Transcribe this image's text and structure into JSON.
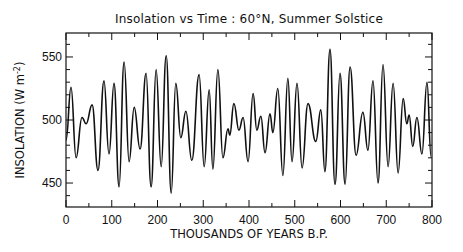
{
  "chart_data": {
    "type": "line",
    "title": "Insolation vs Time : 60°N, Summer Solstice",
    "xlabel": "THOUSANDS OF YEARS B.P.",
    "ylabel": "INSOLATION (W m",
    "ylabel_exp": "-2",
    "ylabel_close": ")",
    "xlim": [
      0,
      800
    ],
    "ylim": [
      431,
      569
    ],
    "x_ticks": [
      0,
      100,
      200,
      300,
      400,
      500,
      600,
      700,
      800
    ],
    "x_tick_labels": [
      "0",
      "100",
      "200",
      "300",
      "400",
      "500",
      "600",
      "700",
      "800"
    ],
    "x_minor_step": 50,
    "y_ticks": [
      450,
      500,
      550
    ],
    "y_tick_labels": [
      "450",
      "500",
      "550"
    ],
    "y_minor_step": 10,
    "grid": false,
    "series": [
      {
        "name": "Insolation",
        "color": "#111111",
        "x": [
          0,
          11,
          22,
          35,
          44,
          57,
          70,
          83,
          94,
          105,
          116,
          127,
          138,
          149,
          162,
          175,
          186,
          197,
          208,
          219,
          230,
          240,
          251,
          262,
          275,
          291,
          302,
          313,
          321,
          332,
          343,
          354,
          358,
          367,
          378,
          387,
          398,
          409,
          417,
          426,
          435,
          446,
          452,
          463,
          474,
          485,
          494,
          505,
          516,
          529,
          546,
          557,
          566,
          577,
          588,
          599,
          610,
          621,
          634,
          649,
          660,
          671,
          682,
          693,
          704,
          715,
          726,
          737,
          745,
          750,
          758,
          767,
          778,
          789,
          798
        ],
        "values": [
          484,
          526,
          470,
          502,
          497,
          512,
          460,
          531,
          473,
          529,
          447,
          546,
          467,
          510,
          477,
          537,
          447,
          540,
          463,
          551,
          442,
          529,
          486,
          507,
          468,
          536,
          463,
          524,
          461,
          540,
          470,
          493,
          488,
          513,
          492,
          502,
          467,
          521,
          492,
          503,
          474,
          505,
          490,
          525,
          456,
          533,
          467,
          529,
          462,
          513,
          483,
          508,
          459,
          556,
          449,
          537,
          449,
          542,
          472,
          506,
          476,
          531,
          450,
          544,
          463,
          529,
          458,
          517,
          497,
          504,
          479,
          502,
          473,
          530,
          471
        ]
      }
    ]
  }
}
